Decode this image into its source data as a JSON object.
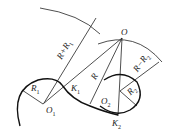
{
  "diagram": {
    "type": "geometric-construction",
    "points": {
      "O": {
        "label": "O",
        "x": 122,
        "y": 38
      },
      "O1": {
        "label": "O",
        "sub": "1",
        "x": 43,
        "y": 104
      },
      "O2": {
        "label": "O",
        "sub": "2",
        "x": 120,
        "y": 91
      },
      "K1": {
        "label": "K",
        "sub": "1",
        "x": 69,
        "y": 91
      },
      "K2": {
        "label": "K",
        "sub": "2",
        "x": 118,
        "y": 115
      }
    },
    "dimensions": {
      "r1": {
        "text": "R",
        "sub": "1"
      },
      "r_plus_r1": {
        "text": "R+R",
        "sub": "1"
      },
      "r": {
        "text": "R"
      },
      "r_minus_r2": {
        "text": "R−R",
        "sub": "2"
      },
      "r2": {
        "text": "R",
        "sub": "2"
      }
    },
    "colors": {
      "stroke": "#222222",
      "background": "#ffffff"
    }
  }
}
